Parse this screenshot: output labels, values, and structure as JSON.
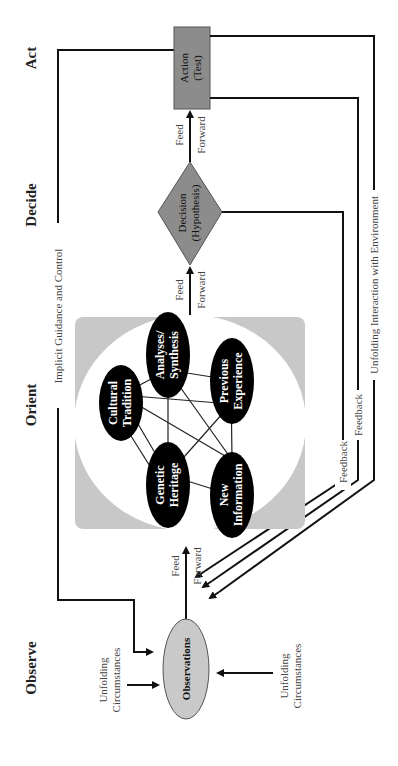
{
  "diagram": {
    "phases": {
      "observe": "Observe",
      "orient": "Orient",
      "decide": "Decide",
      "act": "Act"
    },
    "nodes": {
      "observations": "Observations",
      "decision_line1": "Decision",
      "decision_line2": "(Hypothesis)",
      "action_line1": "Action",
      "action_line2": "(Test)"
    },
    "orient_elements": {
      "cultural_1": "Cultural",
      "cultural_2": "Tradition",
      "analyses_1": "Analyses/",
      "analyses_2": "Synthesis",
      "previous_1": "Previous",
      "previous_2": "Experience",
      "genetic_1": "Genetic",
      "genetic_2": "Heritage",
      "newinfo_1": "New",
      "newinfo_2": "Information"
    },
    "labels": {
      "feed": "Feed",
      "forward": "Forward",
      "implicit_guidance": "Implicit Guidance and Control",
      "feedback": "Feedback",
      "unfolding_interaction": "Unfolding Interaction with Environment",
      "unfolding": "Unfolding",
      "circumstances": "Circumstances"
    },
    "colors": {
      "orient_bg": "#c8c8c8",
      "node_fill": "#000000",
      "shape_fill": "#8c8c8c",
      "observations_fill": "#c9c9c9"
    }
  }
}
